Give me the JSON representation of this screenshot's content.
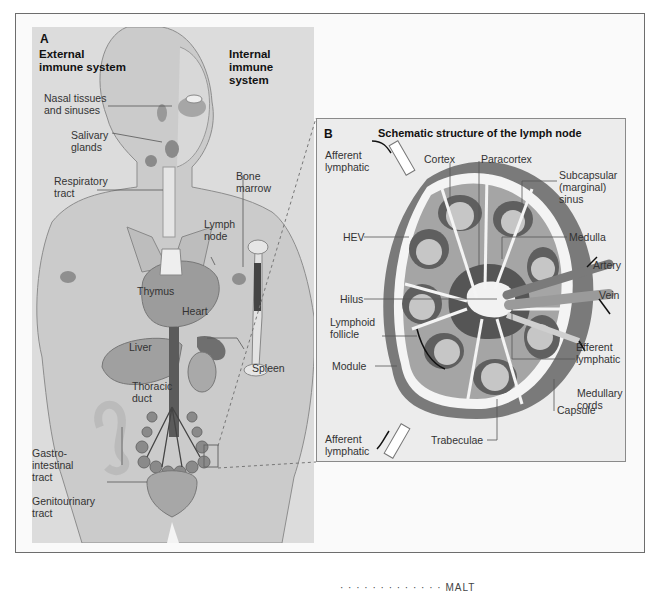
{
  "figure": {
    "panel_a": {
      "letter": "A",
      "headings": {
        "external": "External\nimmune system",
        "internal": "Internal\nimmune system"
      },
      "labels": {
        "nasal": "Nasal tissues\nand sinuses",
        "salivary": "Salivary\nglands",
        "respiratory": "Respiratory\ntract",
        "bone_marrow": "Bone\nmarrow",
        "lymph_node": "Lymph\nnode",
        "thymus": "Thymus",
        "heart": "Heart",
        "liver": "Liver",
        "spleen": "Spleen",
        "thoracic_duct": "Thoracic\nduct",
        "gastro": "Gastro-\nintestinal\ntract",
        "genito": "Genitourinary\ntract"
      }
    },
    "panel_b": {
      "letter": "B",
      "title": "Schematic structure of the lymph node",
      "labels": {
        "afferent_top": "Afferent\nlymphatic",
        "cortex": "Cortex",
        "paracortex": "Paracortex",
        "subcapsular": "Subcapsular\n(marginal)\nsinus",
        "hev": "HEV",
        "medulla": "Medulla",
        "artery": "Artery",
        "vein": "Vein",
        "hilus": "Hilus",
        "lymphoid_follicle": "Lymphoid\nfollicle",
        "efferent": "Efferent\nlymphatic",
        "module": "Module",
        "medullary_cords": "Medullary\ncords",
        "capsule": "Capsule",
        "afferent_bottom": "Afferent\nlymphatic",
        "trabeculae": "Trabeculae"
      }
    },
    "cutoff_caption": "·  ·  ·  ·  ·  ·  ·  ·  ·  ·  ·  ·  ·  MALT"
  },
  "colors": {
    "panel_a_bg": "#dcdcdc",
    "panel_b_bg": "#ececec",
    "tissue_dark": "#6e6e6e",
    "tissue_mid": "#9a9a9a",
    "follicle": "#c4c4c4",
    "body": "#cfcfcf"
  }
}
